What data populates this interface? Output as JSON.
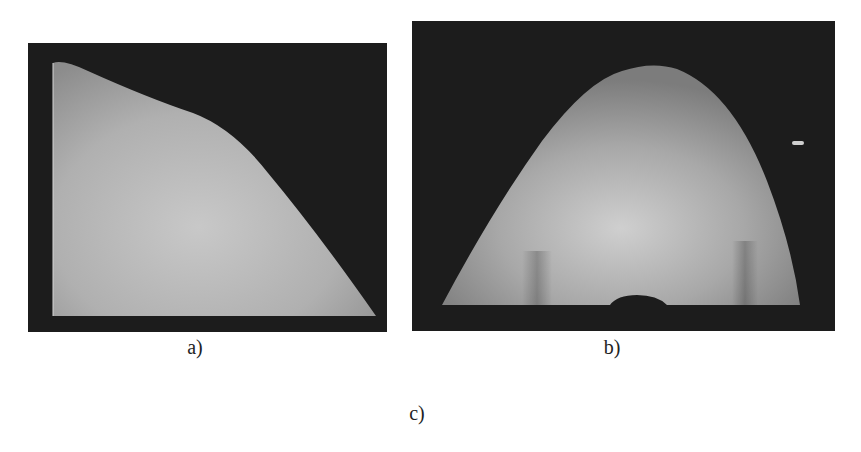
{
  "figure": {
    "panels": [
      {
        "id": "a",
        "caption": "a)",
        "description": "rendered surface, side view"
      },
      {
        "id": "b",
        "caption": "b)",
        "description": "rendered surface, front view"
      }
    ],
    "bottom_caption": "c)"
  },
  "colors": {
    "frame": "#1c1c1c",
    "surface_light": "#c9c9c9",
    "surface_mid": "#a3a3a3",
    "surface_dark": "#7a7a7a",
    "text": "#222222"
  }
}
